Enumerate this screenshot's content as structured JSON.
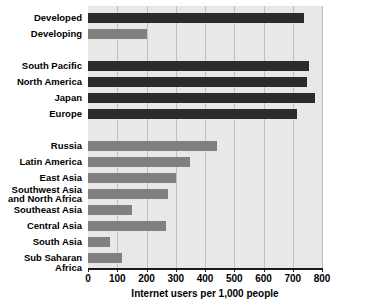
{
  "chart_data": {
    "type": "bar",
    "orientation": "horizontal",
    "title": "",
    "subtitle": "",
    "xlabel": "Internet users per 1,000 people",
    "ylabel": "",
    "xlim": [
      0,
      800
    ],
    "xticks": [
      0,
      100,
      200,
      300,
      400,
      500,
      600,
      700,
      800
    ],
    "xtick_labels": [
      "0",
      "100",
      "200",
      "300",
      "400",
      "500",
      "600",
      "700",
      "800"
    ],
    "grid": "vertical",
    "legend": "none",
    "plot_background": "#e8e8e8",
    "colors": {
      "dark": "#2b2b2b",
      "gray": "#808080",
      "gridline": "#c0c0c0",
      "axis": "#1a1a1a",
      "text": "#000000"
    },
    "categories": [
      "Developed",
      "Developing",
      "",
      "South Pacific",
      "North America",
      "Japan",
      "Europe",
      "",
      "Russia",
      "Latin America",
      "East Asia",
      "Southwest Asia\nand North Africa",
      "Southeast Asia",
      "Central Asia",
      "South Asia",
      "Sub Saharan Africa"
    ],
    "values": [
      740,
      200,
      null,
      755,
      750,
      775,
      715,
      null,
      440,
      350,
      300,
      275,
      150,
      265,
      75,
      115
    ],
    "bar_colors": [
      "dark",
      "gray",
      null,
      "dark",
      "dark",
      "dark",
      "dark",
      null,
      "gray",
      "gray",
      "gray",
      "gray",
      "gray",
      "gray",
      "gray",
      "gray"
    ]
  }
}
